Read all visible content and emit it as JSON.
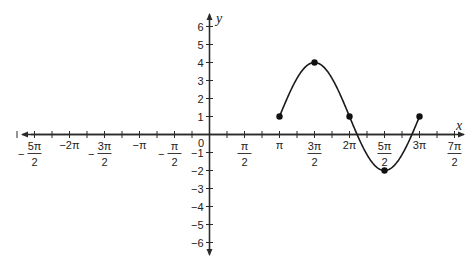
{
  "chart_data": {
    "type": "line",
    "title": "",
    "xlabel": "x",
    "ylabel": "y",
    "xlim_pi": [
      -2.75,
      3.65
    ],
    "ylim": [
      -6.5,
      6.5
    ],
    "grid": false,
    "x_tick_step_pi": 0.25,
    "x_tick_labels": [
      {
        "value_pi": -2.5,
        "num": "5π",
        "den": "2",
        "neg": true
      },
      {
        "value_pi": -2.0,
        "text": "−2π"
      },
      {
        "value_pi": -1.5,
        "num": "3π",
        "den": "2",
        "neg": true
      },
      {
        "value_pi": -1.0,
        "text": "−π"
      },
      {
        "value_pi": -0.5,
        "num": "π",
        "den": "2",
        "neg": true
      },
      {
        "value_pi": 0.5,
        "num": "π",
        "den": "2",
        "neg": false
      },
      {
        "value_pi": 1.0,
        "text": "π"
      },
      {
        "value_pi": 1.5,
        "num": "3π",
        "den": "2",
        "neg": false
      },
      {
        "value_pi": 2.0,
        "text": "2π"
      },
      {
        "value_pi": 2.5,
        "num": "5π",
        "den": "2",
        "neg": false
      },
      {
        "value_pi": 3.0,
        "text": "3π"
      },
      {
        "value_pi": 3.5,
        "num": "7π",
        "den": "2",
        "neg": false
      }
    ],
    "y_ticks": [
      -6,
      -5,
      -4,
      -3,
      -2,
      -1,
      1,
      2,
      3,
      4,
      5,
      6
    ],
    "y_tick_labels": [
      "−6",
      "−5",
      "−4",
      "−3",
      "−2",
      "−1",
      "1",
      "2",
      "3",
      "4",
      "5",
      "6"
    ],
    "origin_label": "0",
    "series": [
      {
        "name": "y = 3 sin(x − π) + 1 (one period, π to 3π)",
        "function": "1 + 3*sin(x - pi)",
        "x_range_pi": [
          1,
          3
        ],
        "points": [
          {
            "x": "π",
            "x_pi": 1.0,
            "y": 1
          },
          {
            "x": "3π/2",
            "x_pi": 1.5,
            "y": 4
          },
          {
            "x": "2π",
            "x_pi": 2.0,
            "y": 1
          },
          {
            "x": "5π/2",
            "x_pi": 2.5,
            "y": -2
          },
          {
            "x": "3π",
            "x_pi": 3.0,
            "y": 1
          }
        ]
      }
    ]
  },
  "colors": {
    "axis": "#2a2a2a",
    "curve": "#1a1a1a",
    "background": "#ffffff"
  }
}
